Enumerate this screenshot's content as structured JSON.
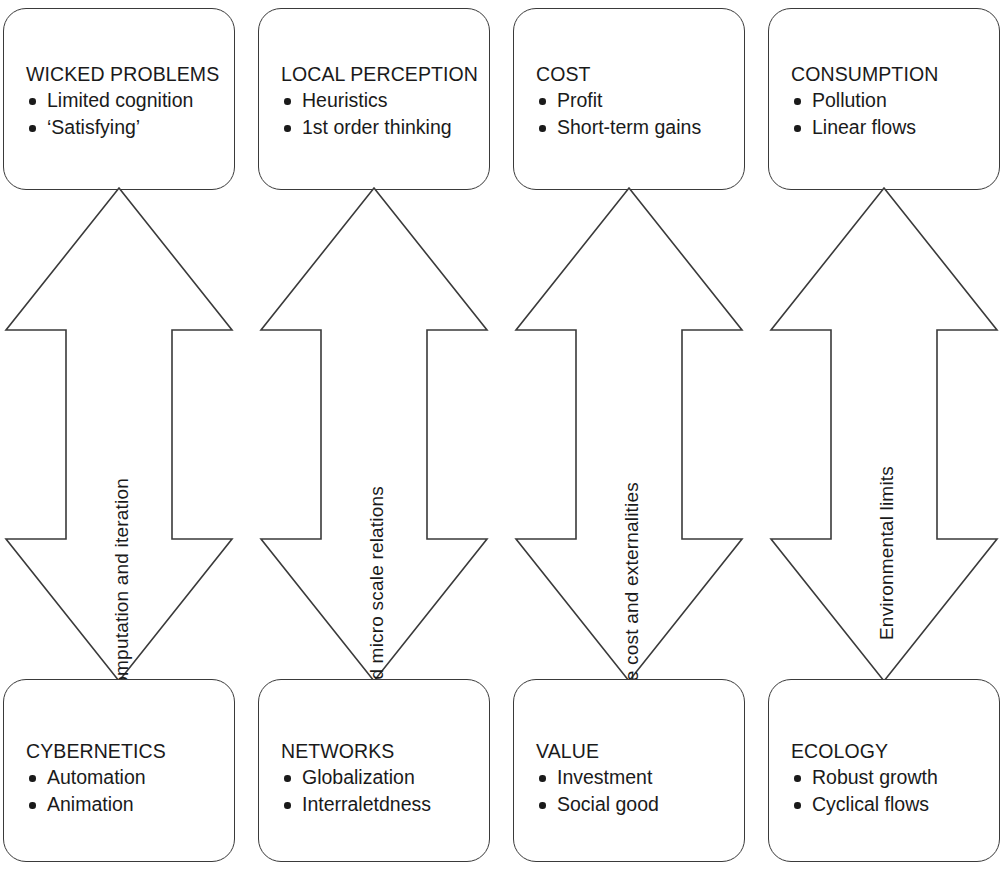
{
  "diagram": {
    "stroke_color": "#3a3a3a",
    "text_color": "#1a1a1a",
    "background_color": "#ffffff",
    "arrow_type": "double-headed-vertical"
  },
  "columns": [
    {
      "id": "column-1",
      "top": {
        "title": "WICKED PROBLEMS",
        "bullets": [
          "Limited cognition",
          "‘Satisfying’"
        ]
      },
      "arrow": {
        "label": "Computation and iteration",
        "direction": "bidirectional"
      },
      "bottom": {
        "title": "CYBERNETICS",
        "bullets": [
          "Automation",
          "Animation"
        ]
      }
    },
    {
      "id": "column-2",
      "top": {
        "title": "LOCAL PERCEPTION",
        "bullets": [
          "Heuristics",
          "1st order thinking"
        ]
      },
      "arrow": {
        "label": "Macro and micro scale relations",
        "direction": "bidirectional"
      },
      "bottom": {
        "title": "NETWORKS",
        "bullets": [
          "Globalization",
          "Interraletdness"
        ]
      }
    },
    {
      "id": "column-3",
      "top": {
        "title": "COST",
        "bullets": [
          "Profit",
          "Short-term gains"
        ]
      },
      "arrow": {
        "label": "Life-cycle cost and externalities",
        "direction": "bidirectional"
      },
      "bottom": {
        "title": "VALUE",
        "bullets": [
          "Investment",
          "Social good"
        ]
      }
    },
    {
      "id": "column-4",
      "top": {
        "title": "CONSUMPTION",
        "bullets": [
          "Pollution",
          "Linear flows"
        ]
      },
      "arrow": {
        "label": "Environmental limits",
        "direction": "bidirectional"
      },
      "bottom": {
        "title": "ECOLOGY",
        "bullets": [
          "Robust growth",
          "Cyclical flows"
        ]
      }
    }
  ]
}
